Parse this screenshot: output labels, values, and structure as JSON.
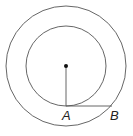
{
  "diagram": {
    "type": "concentric-circles",
    "stroke_color": "#555555",
    "center": {
      "x": 66,
      "y": 66,
      "dot_color": "#111111"
    },
    "outer_circle": {
      "r": 60
    },
    "inner_circle": {
      "r": 40
    },
    "radius_segment": {
      "from": "center",
      "to": "A"
    },
    "tangent_segment": {
      "from": "A",
      "to": "B"
    },
    "points": [
      {
        "label": "A",
        "x": 66,
        "y": 106
      },
      {
        "label": "B",
        "x": 112,
        "y": 106
      }
    ]
  }
}
